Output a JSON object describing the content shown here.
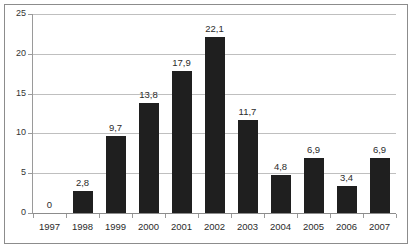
{
  "chart_data": {
    "type": "bar",
    "title": "",
    "subtitle": "",
    "xlabel": "",
    "ylabel": "",
    "categories": [
      "1997",
      "1998",
      "1999",
      "2000",
      "2001",
      "2002",
      "2003",
      "2004",
      "2005",
      "2006",
      "2007"
    ],
    "values": [
      0,
      2.8,
      9.7,
      13.8,
      17.9,
      22.1,
      11.7,
      4.8,
      6.9,
      3.4,
      6.9
    ],
    "data_labels": [
      "0",
      "2,8",
      "9,7",
      "13,8",
      "17,9",
      "22,1",
      "11,7",
      "4,8",
      "6,9",
      "3,4",
      "6,9"
    ],
    "ylim": [
      0,
      25
    ],
    "ytick_values": [
      0,
      5,
      10,
      15,
      20,
      25
    ],
    "ytick_labels": [
      "0",
      "5",
      "10",
      "15",
      "20",
      "25"
    ],
    "grid": true,
    "grid_axis": "y",
    "legend": false,
    "legend_position": "none",
    "decimal_separator": ",",
    "series": [
      {
        "name": "",
        "values": [
          0,
          2.8,
          9.7,
          13.8,
          17.9,
          22.1,
          11.7,
          4.8,
          6.9,
          3.4,
          6.9
        ]
      }
    ],
    "colors": {
      "bar": "#1f1f1f",
      "gridline": "#bfbfbf",
      "axis": "#8c8c8c",
      "text": "#2b2b2b",
      "background": "#ffffff",
      "frame_border": "#8c8c8c"
    }
  }
}
